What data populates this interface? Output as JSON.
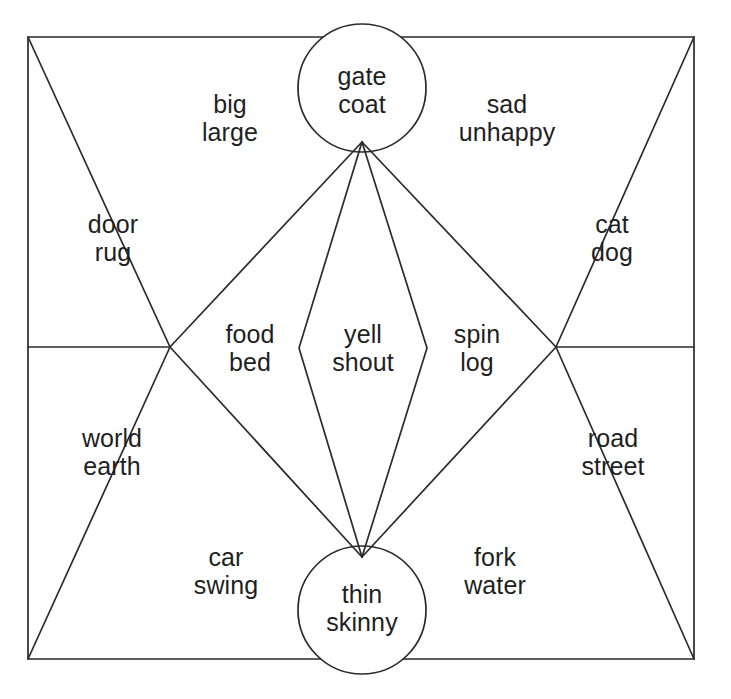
{
  "diagram": {
    "type": "word-association-partition-diagram",
    "shape_outline": "rectangle",
    "stroke_color": "#2b2b2b",
    "fill_color": "#ffffff",
    "background_color": "#ffffff",
    "text_color": "#1f1f1f",
    "regions": [
      {
        "id": "gate-coat",
        "shape": "circle",
        "position": "top-center",
        "lines": [
          "gate",
          "coat"
        ],
        "center": {
          "x": 362,
          "y": 90
        }
      },
      {
        "id": "big-large",
        "shape": "triangle-sector",
        "position": "top-left-of-center",
        "lines": [
          "big",
          "large"
        ],
        "center": {
          "x": 230,
          "y": 118
        }
      },
      {
        "id": "sad-unhappy",
        "shape": "triangle-sector",
        "position": "top-right-of-center",
        "lines": [
          "sad",
          "unhappy"
        ],
        "center": {
          "x": 507,
          "y": 118
        }
      },
      {
        "id": "door-rug",
        "shape": "triangle-sector",
        "position": "upper-left",
        "lines": [
          "door",
          "rug"
        ],
        "center": {
          "x": 113,
          "y": 238
        }
      },
      {
        "id": "cat-dog",
        "shape": "triangle-sector",
        "position": "upper-right",
        "lines": [
          "cat",
          "dog"
        ],
        "center": {
          "x": 612,
          "y": 238
        }
      },
      {
        "id": "food-bed",
        "shape": "lens-sector",
        "position": "center-left",
        "lines": [
          "food",
          "bed"
        ],
        "center": {
          "x": 250,
          "y": 348
        }
      },
      {
        "id": "yell-shout",
        "shape": "lens",
        "position": "center",
        "lines": [
          "yell",
          "shout"
        ],
        "center": {
          "x": 363,
          "y": 348
        }
      },
      {
        "id": "spin-log",
        "shape": "lens-sector",
        "position": "center-right",
        "lines": [
          "spin",
          "log"
        ],
        "center": {
          "x": 477,
          "y": 348
        }
      },
      {
        "id": "world-earth",
        "shape": "triangle-sector",
        "position": "lower-left",
        "lines": [
          "world",
          "earth"
        ],
        "center": {
          "x": 112,
          "y": 452
        }
      },
      {
        "id": "road-street",
        "shape": "triangle-sector",
        "position": "lower-right",
        "lines": [
          "road",
          "street"
        ],
        "center": {
          "x": 613,
          "y": 452
        }
      },
      {
        "id": "car-swing",
        "shape": "triangle-sector",
        "position": "bottom-left-of-center",
        "lines": [
          "car",
          "swing"
        ],
        "center": {
          "x": 226,
          "y": 571
        }
      },
      {
        "id": "fork-water",
        "shape": "triangle-sector",
        "position": "bottom-right-of-center",
        "lines": [
          "fork",
          "water"
        ],
        "center": {
          "x": 495,
          "y": 571
        }
      },
      {
        "id": "thin-skinny",
        "shape": "circle",
        "position": "bottom-center",
        "lines": [
          "thin",
          "skinny"
        ],
        "center": {
          "x": 362,
          "y": 608
        }
      }
    ]
  },
  "geometry": {
    "frame": {
      "left": 28,
      "top": 37,
      "right": 694,
      "bottom": 659
    },
    "top_node": {
      "x": 362,
      "y": 142
    },
    "bottom_node": {
      "x": 362,
      "y": 557
    },
    "left_node": {
      "x": 170,
      "y": 347
    },
    "right_node": {
      "x": 556,
      "y": 347
    },
    "top_circle": {
      "cx": 362,
      "cy": 88,
      "r": 64
    },
    "bottom_circle": {
      "cx": 362,
      "cy": 610,
      "r": 64
    },
    "lens_left_kink": {
      "x": 299,
      "y": 348
    },
    "lens_right_kink": {
      "x": 427,
      "y": 348
    }
  }
}
